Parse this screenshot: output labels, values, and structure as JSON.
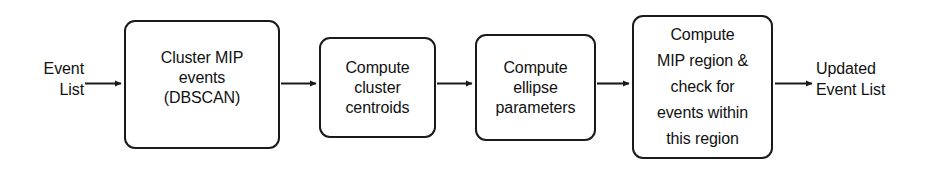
{
  "diagram": {
    "type": "flowchart",
    "orientation": "left-to-right",
    "stroke_color": "#1a1a1a",
    "background_color": "#ffffff",
    "text_color": "#111111"
  },
  "io": {
    "input_label": "Event\nList",
    "output_label": "Updated\nEvent List"
  },
  "nodes": [
    {
      "id": "cluster-mip",
      "label": "Cluster MIP\nevents\n(DBSCAN)",
      "shape": "rounded-rectangle"
    },
    {
      "id": "centroids",
      "label": "Compute\ncluster\ncentroids",
      "shape": "rounded-rectangle"
    },
    {
      "id": "ellipse",
      "label": "Compute\nellipse\nparameters",
      "shape": "rounded-rectangle"
    },
    {
      "id": "mip-region",
      "label": "Compute\nMIP region &\ncheck for\nevents within\nthis region",
      "shape": "rounded-rectangle"
    }
  ],
  "edges": [
    {
      "id": "edge-input",
      "from": "input-label",
      "to": "cluster-mip"
    },
    {
      "id": "edge-1",
      "from": "cluster-mip",
      "to": "centroids"
    },
    {
      "id": "edge-2",
      "from": "centroids",
      "to": "ellipse"
    },
    {
      "id": "edge-3",
      "from": "ellipse",
      "to": "mip-region"
    },
    {
      "id": "edge-output",
      "from": "mip-region",
      "to": "output-label"
    }
  ]
}
